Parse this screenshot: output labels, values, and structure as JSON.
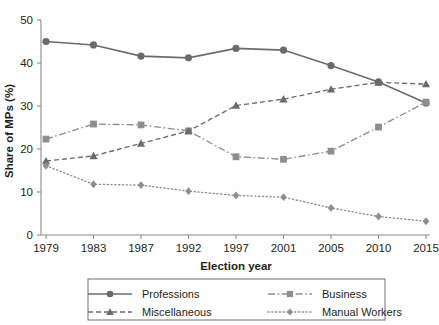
{
  "chart_data": {
    "type": "line",
    "title": "",
    "xlabel": "Election year",
    "ylabel": "Share of MPs (%)",
    "categories": [
      "1979",
      "1983",
      "1987",
      "1992",
      "1997",
      "2001",
      "2005",
      "2010",
      "2015"
    ],
    "x_tick_labels": [
      "1979",
      "1983",
      "1987",
      "1992",
      "1997",
      "2001",
      "2005",
      "2010",
      "2015"
    ],
    "y_tick_labels": [
      "0",
      "10",
      "20",
      "30",
      "40",
      "50"
    ],
    "y_ticks": [
      0,
      10,
      20,
      30,
      40,
      50
    ],
    "ylim": [
      0,
      50
    ],
    "grid": false,
    "legend_position": "bottom",
    "series": [
      {
        "name": "Professions",
        "values": [
          45,
          44.2,
          41.6,
          41.2,
          43.4,
          43,
          39.4,
          35.6,
          30.7
        ],
        "line_style": "solid",
        "marker": "circle",
        "color": "#6b6b6b"
      },
      {
        "name": "Business",
        "values": [
          22.3,
          25.8,
          25.6,
          24.2,
          18.2,
          17.6,
          19.5,
          25.1,
          30.9
        ],
        "line_style": "dashdot",
        "marker": "square",
        "color": "#8e8e8e"
      },
      {
        "name": "Miscellaneous",
        "values": [
          17.2,
          18.4,
          21.3,
          24.2,
          30.1,
          31.6,
          33.9,
          35.5,
          35.1
        ],
        "line_style": "dashed",
        "marker": "triangle",
        "color": "#6b6b6b"
      },
      {
        "name": "Manual Workers",
        "values": [
          16.1,
          11.8,
          11.6,
          10.2,
          9.2,
          8.8,
          6.3,
          4.3,
          3.2
        ],
        "line_style": "dotted",
        "marker": "diamond",
        "color": "#8e8e8e"
      }
    ]
  },
  "legend": {
    "entries": [
      {
        "label": "Professions",
        "marker": "circle-marker",
        "line_style": "solid"
      },
      {
        "label": "Business",
        "marker": "square-marker",
        "line_style": "dashdot"
      },
      {
        "label": "Miscellaneous",
        "marker": "triangle-marker",
        "line_style": "dashed"
      },
      {
        "label": "Manual Workers",
        "marker": "diamond-marker",
        "line_style": "dotted"
      }
    ]
  },
  "colors": {
    "axis": "#8a8a8a",
    "text": "#231f20",
    "dark_series": "#6b6b6b",
    "light_series": "#8e8e8e",
    "legend_border": "#6f6f6f",
    "background": "#ffffff"
  }
}
